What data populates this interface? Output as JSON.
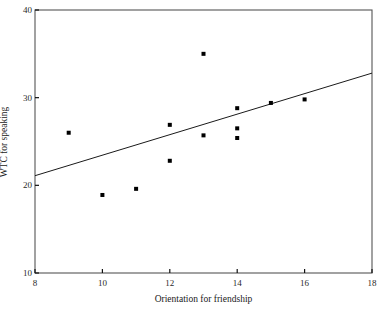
{
  "chart_data": {
    "type": "scatter",
    "title": "",
    "subtitle": "",
    "xlabel": "Orientation for friendship",
    "ylabel": "WTC for speaking",
    "xlim": [
      8,
      18
    ],
    "ylim": [
      10,
      40
    ],
    "xticks": [
      8,
      10,
      12,
      14,
      16,
      18
    ],
    "xtick_labels": [
      "8",
      "10",
      "12",
      "14",
      "16",
      "18"
    ],
    "yticks": [
      10,
      20,
      30,
      40
    ],
    "ytick_labels": [
      "10",
      "20",
      "30",
      "40"
    ],
    "grid": false,
    "legend": null,
    "marker": "square",
    "marker_color": "#000000",
    "marker_size": 4,
    "points": [
      {
        "x": 9,
        "y": 26
      },
      {
        "x": 10,
        "y": 18.9
      },
      {
        "x": 11,
        "y": 19.6
      },
      {
        "x": 12,
        "y": 26.9
      },
      {
        "x": 12,
        "y": 22.8
      },
      {
        "x": 13,
        "y": 35
      },
      {
        "x": 13,
        "y": 25.7
      },
      {
        "x": 14,
        "y": 28.8
      },
      {
        "x": 14,
        "y": 26.5
      },
      {
        "x": 14,
        "y": 25.4
      },
      {
        "x": 15,
        "y": 29.4
      },
      {
        "x": 16,
        "y": 29.8
      }
    ],
    "trend_line": {
      "type": "linear-regression",
      "x_start": 8,
      "y_start": 21.1,
      "x_end": 18,
      "y_end": 32.8,
      "color": "#1a1a1a",
      "width": 1
    },
    "axis_color": "#555555",
    "frame": "box"
  }
}
